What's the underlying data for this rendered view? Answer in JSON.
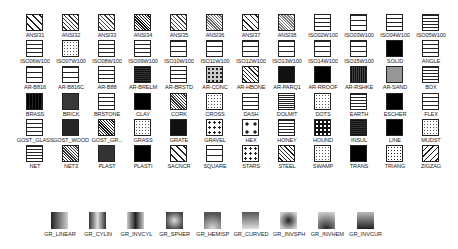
{
  "palette": {
    "rows": [
      [
        "ANSI31",
        "ANSI32",
        "ANSI33",
        "ANSI34",
        "ANSI35",
        "ANSI36",
        "ANSI37",
        "ANSI38",
        "ISO02W100",
        "ISO03W100",
        "ISO04W100",
        "ISO05W100"
      ],
      [
        "ISO06W100",
        "ISO07W100",
        "ISO08W100",
        "ISO09W100",
        "ISO10W100",
        "ISO11W100",
        "ISO12W100",
        "ISO13W100",
        "ISO14W100",
        "ISO15W100",
        "SOLID",
        "ANGLE"
      ],
      [
        "AR-B816",
        "AR-B816C",
        "AR-B88",
        "AR-BRELM",
        "AR-BRSTD",
        "AR-CONC",
        "AR-HBONE",
        "AR-PARQ1",
        "AR-RROOF",
        "AR-RSHKE",
        "AR-SAND",
        "BOX"
      ],
      [
        "BRASS",
        "BRICK",
        "BRSTONE",
        "CLAY",
        "CORK",
        "CROSS",
        "DASH",
        "DOLMIT",
        "DOTS",
        "EARTH",
        "ESCHER",
        "FLEX"
      ],
      [
        "GOST_GLASS",
        "GOST_WOOD",
        "GOST_GR...",
        "GRASS",
        "GRATE",
        "GRAVEL",
        "HEX",
        "HONEY",
        "HOUND",
        "INSUL",
        "LINE",
        "MUDST"
      ],
      [
        "NET",
        "NET3",
        "PLAST",
        "PLASTI",
        "SACNCR",
        "SQUARE",
        "STARS",
        "STEEL",
        "SWAMP",
        "TRANS",
        "TRIANG",
        "ZIGZAG"
      ]
    ],
    "gradients": [
      "GR_LINEAR",
      "GR_CYLIN",
      "GR_INVCYL",
      "GR_SPHER",
      "GR_HEMISP",
      "GR_CURVED",
      "GR_INVSPH",
      "GR_INVHEM",
      "GR_INVCUR"
    ]
  },
  "colors": {
    "background": "#ffffff",
    "stroke": "#222222",
    "label": "#222222",
    "gradient_dark": "#2a2a2a",
    "gradient_light": "#d8d8d8"
  }
}
